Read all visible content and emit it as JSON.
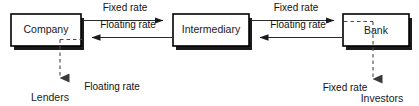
{
  "diagram": {
    "type": "flow-diagram",
    "colors": {
      "box_fill": "#ffffff",
      "box_stroke": "#000000",
      "box_shadow": "#1b1b1b",
      "solid_connector": "#2a2a2a",
      "dashed_connector": "#4a4a4a",
      "text": "#1a1a1a",
      "background": "#ffffff"
    },
    "nodes": [
      {
        "id": "company",
        "label": "Company",
        "shape": "rectangle-shadowed"
      },
      {
        "id": "intermediary",
        "label": "Intermediary",
        "shape": "rectangle-shadowed"
      },
      {
        "id": "bank",
        "label": "Bank",
        "shape": "rectangle-shadowed"
      },
      {
        "id": "lenders",
        "label": "Lenders",
        "shape": "text"
      },
      {
        "id": "investors",
        "label": "Investors",
        "shape": "text"
      }
    ],
    "edges": [
      {
        "id": "company-to-intermediary-fixed",
        "from": "company",
        "to": "intermediary",
        "label": "Fixed rate",
        "style": "solid",
        "direction": "right"
      },
      {
        "id": "intermediary-to-company-floating",
        "from": "intermediary",
        "to": "company",
        "label": "Floating rate",
        "style": "solid",
        "direction": "left"
      },
      {
        "id": "intermediary-to-bank-fixed",
        "from": "intermediary",
        "to": "bank",
        "label": "Fixed rate",
        "style": "solid",
        "direction": "right"
      },
      {
        "id": "bank-to-intermediary-floating",
        "from": "bank",
        "to": "intermediary",
        "label": "Floating rate",
        "style": "solid",
        "direction": "left"
      },
      {
        "id": "company-to-lenders-floating",
        "from": "company",
        "to": "lenders",
        "label": "Floating rate",
        "style": "dashed",
        "direction": "down"
      },
      {
        "id": "bank-to-investors-fixed",
        "from": "bank",
        "to": "investors",
        "label": "Fixed rate",
        "style": "dashed",
        "direction": "down"
      }
    ]
  }
}
